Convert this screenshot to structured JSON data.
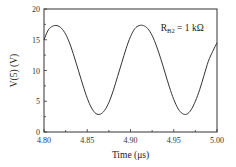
{
  "chart_data": {
    "type": "line",
    "title": "",
    "xlabel": "Time (μs)",
    "ylabel": "V(5)  (V)",
    "xlim": [
      4.8,
      5.0
    ],
    "ylim": [
      0,
      20
    ],
    "x_ticks": [
      "4.80",
      "4.85",
      "4.90",
      "4.95",
      "5.00"
    ],
    "y_ticks": [
      "0",
      "5",
      "10",
      "15",
      "20"
    ],
    "grid": false,
    "legend": null,
    "annotations": [
      {
        "text_main": "R",
        "text_sub": "B2",
        "text_rest": " = 1 kΩ",
        "x": 4.935,
        "y": 16.5
      }
    ],
    "series": [
      {
        "name": "V(5)",
        "x": [
          4.8,
          4.805,
          4.81,
          4.815,
          4.82,
          4.825,
          4.83,
          4.835,
          4.84,
          4.845,
          4.85,
          4.855,
          4.86,
          4.865,
          4.87,
          4.875,
          4.88,
          4.885,
          4.89,
          4.895,
          4.9,
          4.905,
          4.91,
          4.915,
          4.92,
          4.925,
          4.93,
          4.935,
          4.94,
          4.945,
          4.95,
          4.955,
          4.96,
          4.965,
          4.97,
          4.975,
          4.98,
          4.985,
          4.99,
          4.995,
          5.0
        ],
        "values": [
          15.0,
          16.6,
          17.2,
          17.3,
          16.9,
          15.9,
          14.3,
          12.2,
          9.9,
          7.6,
          5.5,
          3.9,
          3.0,
          2.9,
          3.5,
          4.8,
          6.7,
          9.0,
          11.3,
          13.6,
          15.5,
          16.8,
          17.3,
          17.3,
          16.8,
          15.7,
          14.0,
          11.9,
          9.6,
          7.3,
          5.3,
          3.8,
          3.0,
          2.9,
          3.6,
          5.0,
          6.9,
          9.2,
          11.5,
          13.1,
          14.5
        ]
      }
    ]
  }
}
